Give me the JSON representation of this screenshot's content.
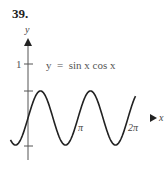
{
  "problem_number": "39.",
  "chart_data": {
    "type": "line",
    "title": "",
    "annotation": "y  =  sin x cos x",
    "xlabel": "x",
    "ylabel": "y",
    "x_ticks": [
      "π",
      "2π"
    ],
    "y_ticks": [
      "1"
    ],
    "function": "y = sin(x)cos(x)",
    "xlim": [
      -0.4,
      2.2
    ],
    "ylim": [
      -1.3,
      1.5
    ],
    "series": [
      {
        "name": "sin x cos x",
        "x_range": [
          -0.35,
          2.15
        ],
        "amplitude": 0.5,
        "period": "π"
      }
    ],
    "grid": false,
    "legend": "none"
  },
  "colors": {
    "curve": "#222222",
    "axis_left": "#e07070",
    "axis_right": "#4fb6c0",
    "y_axis": "#555555"
  }
}
